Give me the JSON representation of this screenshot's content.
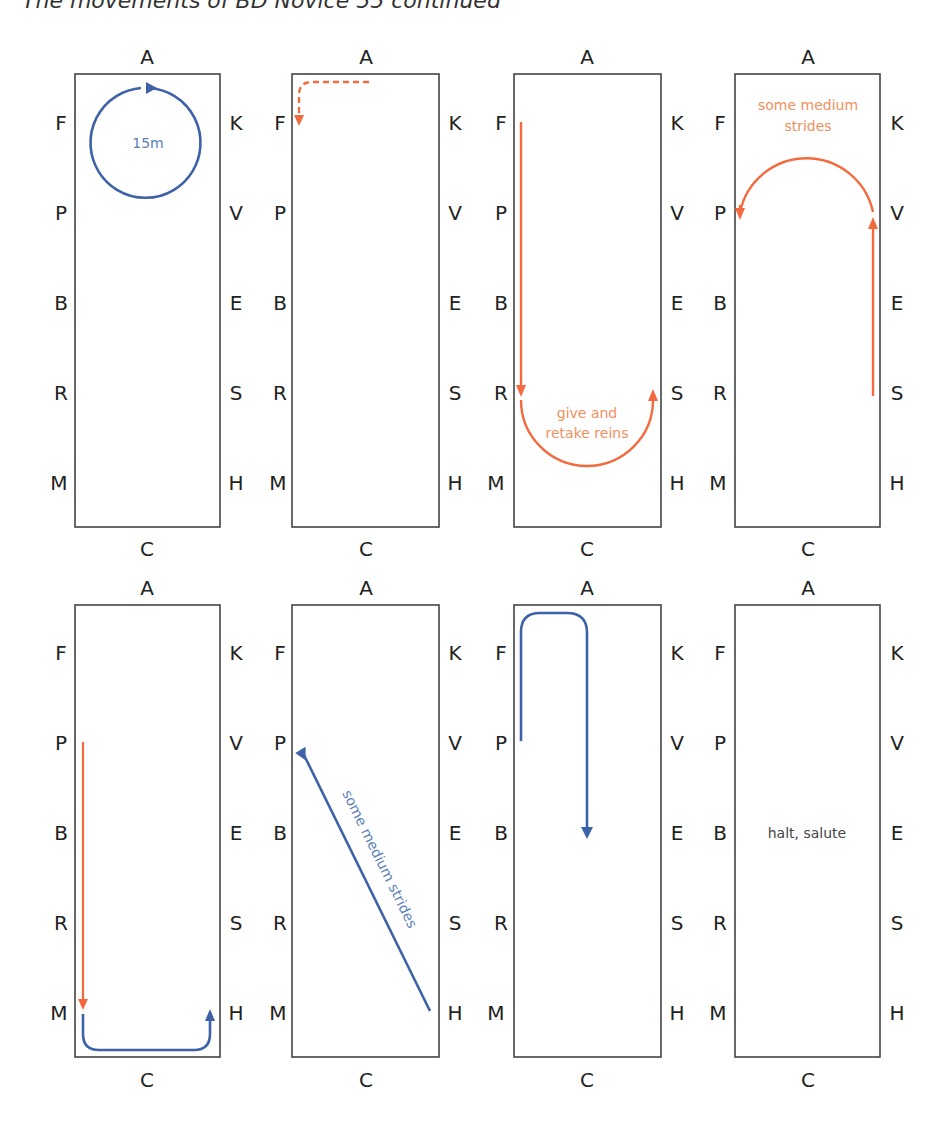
{
  "title": "The movements of BD Novice 55 continued",
  "colors": {
    "orange": "#f26a3d",
    "orange_text": "#f0905e",
    "blue": "#3d62a8",
    "blue_text": "#5a7fb8",
    "dark_text": "#444444",
    "border": "#444444"
  },
  "arena_letters": {
    "top": "A",
    "bottom": "C",
    "left": [
      "F",
      "P",
      "B",
      "R",
      "M"
    ],
    "right": [
      "K",
      "V",
      "E",
      "S",
      "H"
    ]
  },
  "diagrams": [
    {
      "id": 1,
      "row": 1,
      "movement": "15m circle",
      "annotation": "15m",
      "color": "blue"
    },
    {
      "id": 2,
      "row": 1,
      "movement": "dashed turn from A toward F",
      "annotation": "",
      "color": "orange"
    },
    {
      "id": 3,
      "row": 1,
      "movement": "F to R then half circle to S",
      "annotation_lines": [
        "give and",
        "retake reins"
      ],
      "color": "orange"
    },
    {
      "id": 4,
      "row": 1,
      "movement": "S to V then half circle to P",
      "annotation_lines": [
        "some medium",
        "strides"
      ],
      "color": "orange"
    },
    {
      "id": 5,
      "row": 2,
      "movement": "P to M then around C to H",
      "annotation": "",
      "color": "orange/blue"
    },
    {
      "id": 6,
      "row": 2,
      "movement": "H diagonal to P",
      "annotation": "some medium strides",
      "color": "blue"
    },
    {
      "id": 7,
      "row": 2,
      "movement": "P up to A, turn down centre line",
      "annotation": "",
      "color": "blue"
    },
    {
      "id": 8,
      "row": 2,
      "movement": "halt at X",
      "annotation": "halt, salute",
      "color": "dark"
    }
  ]
}
